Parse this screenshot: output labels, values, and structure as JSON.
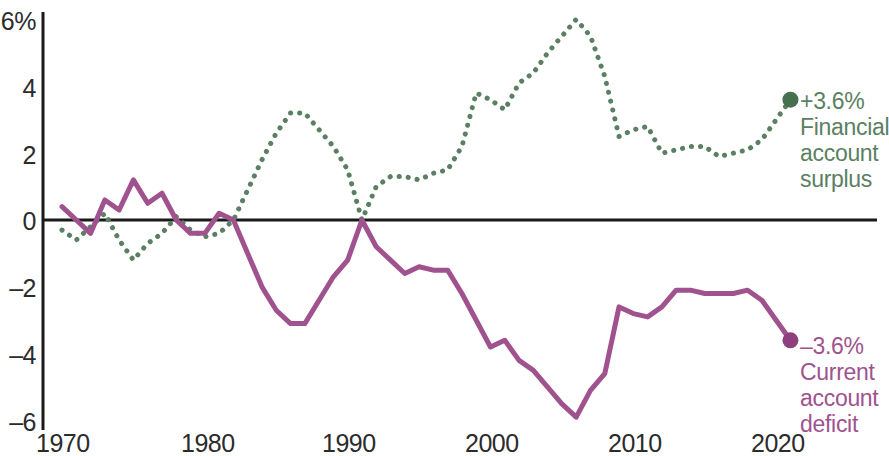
{
  "chart_data": {
    "type": "line",
    "title": "",
    "subtitle": "",
    "xlabel": "",
    "ylabel": "",
    "xlim": [
      1970,
      2021
    ],
    "ylim": [
      -6,
      6
    ],
    "yticks": [
      "6%",
      "4",
      "2",
      "0",
      "-2",
      "-4",
      "-6"
    ],
    "ytick_values": [
      6,
      4,
      2,
      0,
      -2,
      -4,
      -6
    ],
    "xticks": [
      "1970",
      "1980",
      "1990",
      "2000",
      "2010",
      "2020"
    ],
    "xtick_values": [
      1970,
      1980,
      1990,
      2000,
      2010,
      2020
    ],
    "grid": false,
    "zero_line": true,
    "legend_position": "right-inline-annotation",
    "units": "percent of GDP",
    "series": [
      {
        "name": "Financial account surplus",
        "style": "dotted",
        "color": "#5a7f63",
        "end_label_value": "+3.6%",
        "end_label_text": "Financial account surplus",
        "end_point": {
          "x": 2021,
          "y": 3.6
        },
        "x": [
          1970,
          1971,
          1972,
          1973,
          1974,
          1975,
          1976,
          1977,
          1978,
          1979,
          1980,
          1981,
          1982,
          1983,
          1984,
          1985,
          1986,
          1987,
          1988,
          1989,
          1990,
          1991,
          1992,
          1993,
          1994,
          1995,
          1996,
          1997,
          1998,
          1999,
          2000,
          2001,
          2002,
          2003,
          2004,
          2005,
          2006,
          2007,
          2008,
          2009,
          2010,
          2011,
          2012,
          2013,
          2014,
          2015,
          2016,
          2017,
          2018,
          2019,
          2020,
          2021
        ],
        "y": [
          -0.3,
          -0.6,
          -0.2,
          0.2,
          -0.6,
          -1.2,
          -0.7,
          -0.4,
          0.1,
          -0.3,
          -0.5,
          -0.4,
          0.0,
          0.9,
          1.8,
          2.6,
          3.2,
          3.2,
          2.7,
          2.2,
          1.5,
          0.0,
          1.0,
          1.3,
          1.3,
          1.2,
          1.4,
          1.5,
          2.2,
          3.8,
          3.6,
          3.3,
          4.1,
          4.4,
          5.0,
          5.5,
          6.0,
          5.5,
          4.3,
          2.5,
          2.7,
          2.8,
          2.0,
          2.1,
          2.2,
          2.2,
          1.9,
          2.0,
          2.1,
          2.4,
          3.0,
          3.6
        ]
      },
      {
        "name": "Current account deficit",
        "style": "solid",
        "color": "#a0528e",
        "end_label_value": "-3.6%",
        "end_label_text": "Current account deficit",
        "end_point": {
          "x": 2021,
          "y": -3.6
        },
        "x": [
          1970,
          1971,
          1972,
          1973,
          1974,
          1975,
          1976,
          1977,
          1978,
          1979,
          1980,
          1981,
          1982,
          1983,
          1984,
          1985,
          1986,
          1987,
          1988,
          1989,
          1990,
          1991,
          1992,
          1993,
          1994,
          1995,
          1996,
          1997,
          1998,
          1999,
          2000,
          2001,
          2002,
          2003,
          2004,
          2005,
          2006,
          2007,
          2008,
          2009,
          2010,
          2011,
          2012,
          2013,
          2014,
          2015,
          2016,
          2017,
          2018,
          2019,
          2020,
          2021
        ],
        "y": [
          0.4,
          0.0,
          -0.4,
          0.6,
          0.3,
          1.2,
          0.5,
          0.8,
          0.0,
          -0.4,
          -0.4,
          0.2,
          0.0,
          -1.0,
          -2.0,
          -2.7,
          -3.1,
          -3.1,
          -2.4,
          -1.7,
          -1.2,
          0.0,
          -0.8,
          -1.2,
          -1.6,
          -1.4,
          -1.5,
          -1.5,
          -2.2,
          -3.0,
          -3.8,
          -3.6,
          -4.2,
          -4.5,
          -5.0,
          -5.5,
          -5.9,
          -5.1,
          -4.6,
          -2.6,
          -2.8,
          -2.9,
          -2.6,
          -2.1,
          -2.1,
          -2.2,
          -2.2,
          -2.2,
          -2.1,
          -2.4,
          -3.0,
          -3.6
        ]
      }
    ]
  },
  "annotations": {
    "green": {
      "value": "+3.6%",
      "line1": "Financial",
      "line2": "account",
      "line3": "surplus"
    },
    "purple": {
      "value": "–3.6%",
      "line1": "Current",
      "line2": "account",
      "line3": "deficit"
    }
  },
  "axis": {
    "y_labels": [
      "6%",
      "4",
      "2",
      "0",
      "–2",
      "–4",
      "–6"
    ],
    "x_labels": [
      "1970",
      "1980",
      "1990",
      "2000",
      "2010",
      "2020"
    ]
  },
  "colors": {
    "green": "#5a7f63",
    "purple": "#a0528e",
    "axis": "#1a1a1a",
    "text": "#2b2b2b"
  }
}
